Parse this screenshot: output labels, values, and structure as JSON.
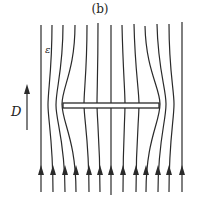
{
  "figure": {
    "title": "(b)",
    "labels": {
      "epsilon": "ε",
      "field": "D"
    },
    "colors": {
      "line": "#2a2a2a",
      "background": "#ffffff"
    },
    "field_lines": {
      "count": 13,
      "direction": "up",
      "bottom_x": [
        41,
        53,
        65,
        76,
        89,
        100,
        111,
        123,
        136,
        146,
        158,
        169,
        182
      ]
    },
    "plate": {
      "x": 62,
      "y": 103,
      "width": 97,
      "height": 5
    }
  }
}
